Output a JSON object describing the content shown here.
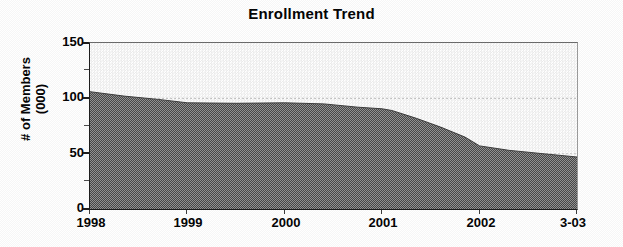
{
  "chart_data": {
    "type": "area",
    "title": "Enrollment Trend",
    "xlabel": "",
    "ylabel": "# of Members (000)",
    "ylabel_line1": "# of Members",
    "ylabel_line2": "(000)",
    "ylim": [
      0,
      150
    ],
    "y_ticks": [
      0,
      50,
      100,
      150
    ],
    "y_tick_labels": [
      "0",
      "50",
      "100",
      "150"
    ],
    "y_minor_ticks": [
      25,
      75,
      125
    ],
    "grid": true,
    "gridlines": [
      50,
      100
    ],
    "legend": "none",
    "categories": [
      "1998",
      "1999",
      "2000",
      "2001",
      "2002",
      "3-03"
    ],
    "x_tick_labels": [
      "1998",
      "1999",
      "2000",
      "2001",
      "2002",
      "3-03"
    ],
    "series": [
      {
        "name": "Members",
        "values": [
          106,
          96,
          96,
          90,
          55,
          47
        ],
        "detail_x": [
          1998.0,
          1998.35,
          1998.7,
          1999.0,
          1999.5,
          2000.0,
          2000.4,
          2000.75,
          2001.0,
          2001.1,
          2001.35,
          2001.6,
          2001.85,
          2002.0,
          2002.3,
          2002.65,
          2003.0
        ],
        "detail_y": [
          106,
          102,
          99,
          96,
          95.5,
          96,
          95,
          92,
          90.5,
          89,
          82,
          74,
          65,
          57,
          53,
          50,
          47
        ],
        "fill_color": "#6e6e6e",
        "pattern": "50% dither"
      }
    ],
    "plot_background_color": "#fafafa",
    "axis_color": "#1a1a1a",
    "gridline_color": "#b8b8b8"
  }
}
